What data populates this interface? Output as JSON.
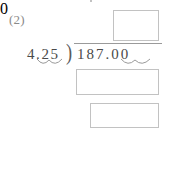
{
  "problem": {
    "label": "(2)",
    "divisor": "4.25",
    "dividend": "187.00",
    "bracket_glyph": ")",
    "remainder": "0"
  },
  "boxes": {
    "answer_box": "",
    "subtract_box_1": "",
    "subtract_box_2": "",
    "subtract_box_3": ""
  },
  "marks": {
    "divisor_decimal_arc": "decimal-shift-arc",
    "dividend_decimal_arc": "decimal-shift-arc"
  },
  "colors": {
    "ink": "#4a4a4a",
    "label_ink": "#8a8a8a",
    "rule": "#a8a8a8",
    "box_border": "#c2c2c2",
    "paper": "#ffffff"
  }
}
